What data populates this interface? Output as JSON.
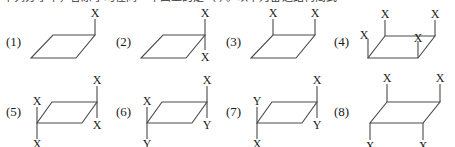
{
  "header": {
    "clipped_text": "下列分子中，各原子均在同一平面上的是（  ）。以下为备选结构简式"
  },
  "figures": [
    {
      "id": "fig-1",
      "number": "(1)",
      "labels": [
        "X"
      ],
      "description": "parallelogram with one vertical bond up at top-right corner labeled X"
    },
    {
      "id": "fig-2",
      "number": "(2)",
      "labels": [
        "X",
        "X"
      ],
      "description": "parallelogram with vertical bonds up and down at top-right corner, both labeled X"
    },
    {
      "id": "fig-3",
      "number": "(3)",
      "labels": [
        "X",
        "X"
      ],
      "description": "parallelogram with vertical bonds up at top-left and top-right corners, both labeled X"
    },
    {
      "id": "fig-4",
      "number": "(4)",
      "labels": [
        "X",
        "X",
        "X",
        "X"
      ],
      "description": "parallelogram with bonds up at top-left and top-right, bond down at left to lower-left vertex labeled X, and bond up at bottom-right corner labeled X"
    },
    {
      "id": "fig-5",
      "number": "(5)",
      "labels": [
        "X",
        "X",
        "X",
        "X"
      ],
      "description": "parallelogram with vertical bonds up and down through top-right corner and through bottom-left corner, all four labeled X"
    },
    {
      "id": "fig-6",
      "number": "(6)",
      "labels": [
        "X",
        "Y",
        "X",
        "Y"
      ],
      "description": "parallelogram with vertical bonds through top-right corner (X up, Y down) and through bottom-left corner (X up, Y down)"
    },
    {
      "id": "fig-7",
      "number": "(7)",
      "labels": [
        "X",
        "Y",
        "Y",
        "X"
      ],
      "description": "parallelogram with vertical bonds through top-right corner (X up, Y down) and through bottom-left corner (Y up, X down)"
    },
    {
      "id": "fig-8",
      "number": "(8)",
      "labels": [
        "X",
        "X",
        "X",
        "X"
      ],
      "description": "parallelogram with vertical bonds up at both top corners and down at both bottom corners, all labeled X"
    }
  ],
  "style": {
    "stroke_color": "#4a4a4a",
    "text_color": "#1a1a1a",
    "background": "#ffffff"
  }
}
